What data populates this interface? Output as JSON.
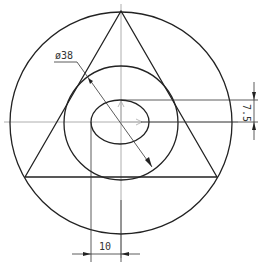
{
  "drawing": {
    "type": "engineering-drawing",
    "colors": {
      "line": "#222222",
      "centerline": "#9a9a9a",
      "dimension": "#333333",
      "background": "#ffffff"
    },
    "outer_circle": {
      "cx": 121,
      "cy": 123,
      "r": 111
    },
    "middle_circle": {
      "cx": 121,
      "cy": 123,
      "r": 57
    },
    "inner_ellipse": {
      "cx": 120,
      "cy": 122,
      "rx": 29,
      "ry": 22
    },
    "triangle": {
      "points": "121,11 25,177 217,177"
    },
    "dimensions": {
      "diameter": {
        "label": "ø38"
      },
      "vertical_offset": {
        "label": "7.5"
      },
      "horizontal_offset": {
        "label": "10"
      }
    }
  }
}
